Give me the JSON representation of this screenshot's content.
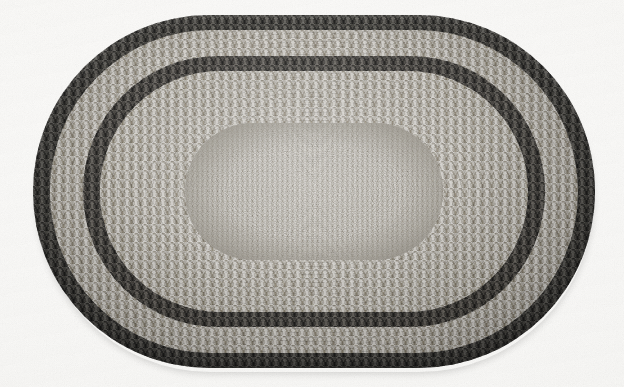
{
  "image": {
    "kind": "photograph",
    "subject": "braided oval rug",
    "orientation": "landscape",
    "palette": "monochrome-grayscale",
    "background_color": "#fdfdfc",
    "caption": ""
  },
  "canvas": {
    "width": 624,
    "height": 387
  },
  "rug": {
    "shape": "oval",
    "bounds": {
      "left": 33,
      "top": 15,
      "width": 562,
      "height": 353
    },
    "bands": [
      {
        "name": "outer-dark-border",
        "label": "outer dark braided border",
        "color": "#3d3c39",
        "tone": "dark",
        "texture": "coarse-braid",
        "bounds": {
          "left": 0,
          "top": 0,
          "width": 562,
          "height": 353
        },
        "radius": 176
      },
      {
        "name": "light-braid-ring",
        "label": "pale braided ring",
        "color": "#a9a59d",
        "tone": "light",
        "texture": "coarse-braid",
        "bounds": {
          "left": 17,
          "top": 15,
          "width": 528,
          "height": 323
        },
        "radius": 161
      },
      {
        "name": "inner-dark-ring",
        "label": "inner dark separator ring",
        "color": "#403e3b",
        "tone": "dark",
        "texture": "coarse-braid",
        "bounds": {
          "left": 50,
          "top": 41,
          "width": 462,
          "height": 271
        },
        "radius": 135
      },
      {
        "name": "mid-field",
        "label": "broad mottled mid field",
        "color": "#a7a39b",
        "tone": "light",
        "texture": "coarse-braid",
        "bounds": {
          "left": 67,
          "top": 56,
          "width": 428,
          "height": 241
        },
        "radius": 120
      },
      {
        "name": "center-medallion",
        "label": "fine textured centre medallion",
        "color": "#a9a59d",
        "tone": "light",
        "texture": "fine-braid",
        "bounds": {
          "left": 152,
          "top": 108,
          "width": 258,
          "height": 137
        },
        "radius": 68
      }
    ],
    "colors": {
      "dark_border": "#3d3c39",
      "light_band": "#a9a59d",
      "dark_band": "#403e3b",
      "mid_field": "#a7a39b",
      "center": "#a9a59d",
      "highlight": "#c8c4bc",
      "shadow": "#2c2b29"
    }
  }
}
